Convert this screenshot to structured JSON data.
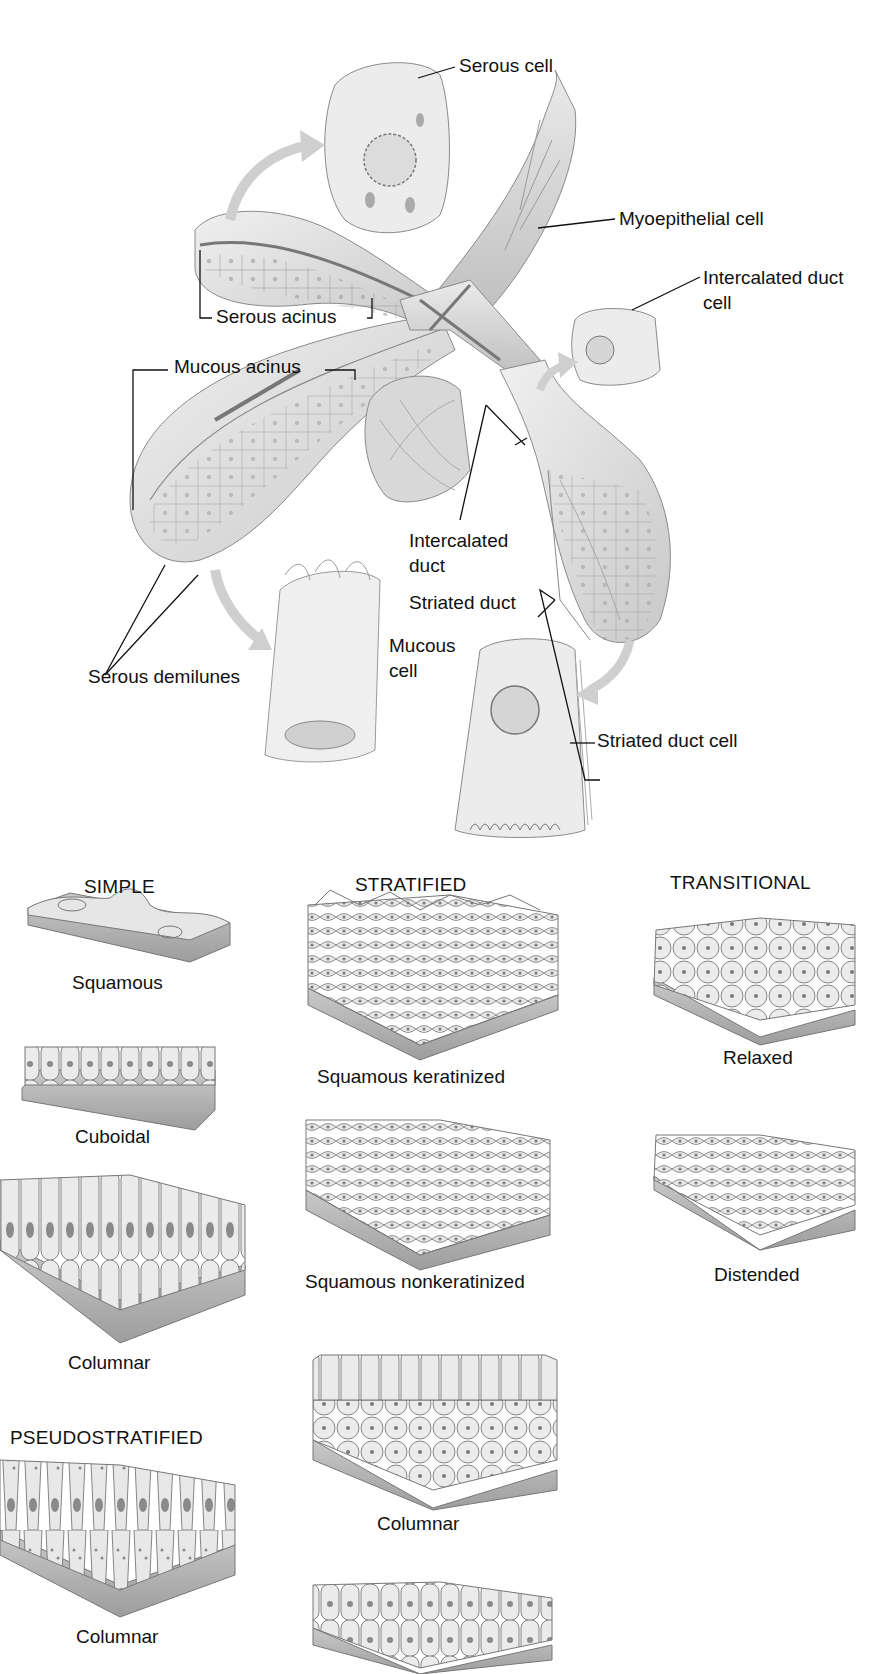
{
  "gland": {
    "labels": {
      "serous_cell": "Serous cell",
      "myoepithelial_cell": "Myoepithelial cell",
      "intercalated_duct_cell_l1": "Intercalated duct",
      "intercalated_duct_cell_l2": "cell",
      "serous_acinus": "Serous acinus",
      "mucous_acinus": "Mucous acinus",
      "intercalated_duct_l1": "Intercalated",
      "intercalated_duct_l2": "duct",
      "striated_duct": "Striated duct",
      "mucous_cell_l1": "Mucous",
      "mucous_cell_l2": "cell",
      "serous_demilunes": "Serous demilunes",
      "striated_duct_cell": "Striated duct cell"
    }
  },
  "epithelium": {
    "columns": {
      "simple": "SIMPLE",
      "stratified": "STRATIFIED",
      "transitional": "TRANSITIONAL",
      "pseudostratified": "PSEUDOSTRATIFIED"
    },
    "simple": [
      "Squamous",
      "Cuboidal",
      "Columnar"
    ],
    "stratified": [
      "Squamous keratinized",
      "Squamous nonkeratinized",
      "Columnar"
    ],
    "transitional": [
      "Relaxed",
      "Distended"
    ],
    "pseudostratified": [
      "Columnar"
    ]
  },
  "colors": {
    "tissue_fill": "#e4e4e4",
    "tissue_shade": "#bdbdbd",
    "tissue_dark": "#8a8a8a",
    "outline": "#6b6b6b",
    "arrow": "#c8c8c8",
    "text": "#111111"
  }
}
